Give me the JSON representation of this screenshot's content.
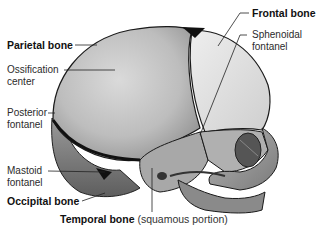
{
  "figure": {
    "labels": {
      "parietal_bone": "Parietal bone",
      "ossification_center_line1": "Ossification",
      "ossification_center_line2": "center",
      "posterior_fontanel_line1": "Posterior",
      "posterior_fontanel_line2": "fontanel",
      "mastoid_fontanel_line1": "Mastoid",
      "mastoid_fontanel_line2": "fontanel",
      "occipital_bone": "Occipital bone",
      "temporal_bone": "Temporal bone",
      "temporal_bone_suffix": "(squamous portion)",
      "frontal_bone": "Frontal bone",
      "sphenoidal_fontanel_line1": "Sphenoidal",
      "sphenoidal_fontanel_line2": "fontanel"
    },
    "colors": {
      "parietal": "#c4c4c4",
      "frontal": "#dcdcdc",
      "suture": "#111111",
      "occipital": "#8e8e8e",
      "leader_line": "#222222"
    }
  }
}
